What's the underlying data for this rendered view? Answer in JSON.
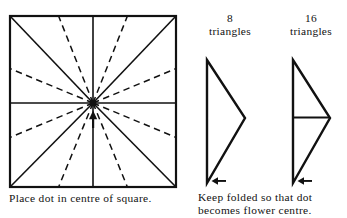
{
  "figure": {
    "title_text": "Folded square flower instruction diagram",
    "stroke_color": "#111111",
    "background_color": "#ffffff"
  },
  "square_diagram": {
    "name": "square-with-radial-folds",
    "caption": "Place dot in centre of square.",
    "center_dot_label": "centre dot",
    "arrow_label": "fold arrow pointing up at centre",
    "solid_fold_count": 8,
    "dashed_fold_count": 8,
    "solid_fold_angles_deg": [
      0,
      45,
      90,
      135,
      180,
      225,
      270,
      315
    ],
    "dashed_fold_angles_deg": [
      22.5,
      67.5,
      112.5,
      157.5,
      202.5,
      247.5,
      292.5,
      337.5
    ]
  },
  "triangles": [
    {
      "count": "8",
      "word": "triangles",
      "name": "triangle-8",
      "arrow_label": "left arrow at bottom point",
      "has_mid_line": false
    },
    {
      "count": "16",
      "word": "triangles",
      "name": "triangle-16",
      "arrow_label": "left arrow at bottom point",
      "has_mid_line": true
    }
  ],
  "right_caption": "Keep folded so that dot\nbecomes flower centre."
}
